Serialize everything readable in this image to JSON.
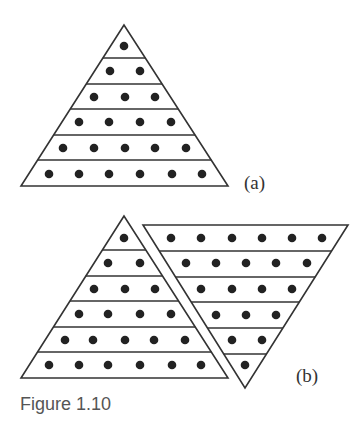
{
  "figure": {
    "caption": "Figure 1.10",
    "label_a": "(a)",
    "label_b": "(b)",
    "stroke_color": "#333333",
    "dot_color": "#222222"
  },
  "panel_a": {
    "description": "Triangular arrangement of dots, rows of 1 to 6",
    "triangle": {
      "apex": [
        124,
        25
      ],
      "base_left": [
        21,
        186
      ],
      "base_right": [
        228,
        186
      ]
    },
    "row_lines_y": [
      58,
      84,
      109,
      135,
      160
    ],
    "rows": [
      {
        "y": 46,
        "x": [
          124
        ]
      },
      {
        "y": 71,
        "x": [
          110,
          140
        ]
      },
      {
        "y": 97,
        "x": [
          94,
          125,
          155
        ]
      },
      {
        "y": 122,
        "x": [
          79,
          109,
          140,
          171
        ]
      },
      {
        "y": 148,
        "x": [
          63,
          94,
          125,
          155,
          186
        ]
      },
      {
        "y": 174,
        "x": [
          49,
          79,
          109,
          140,
          172,
          202
        ]
      }
    ]
  },
  "panel_b": {
    "description": "Two triangles of dots combined into a parallelogram (1..6 plus inverted 6..1)",
    "left_triangle": {
      "apex": [
        124,
        216
      ],
      "base_left": [
        21,
        378
      ],
      "base_right": [
        228,
        378
      ]
    },
    "left_row_lines_y": [
      250,
      276,
      301,
      327,
      352
    ],
    "left_rows": [
      {
        "y": 238,
        "x": [
          124
        ]
      },
      {
        "y": 263,
        "x": [
          108,
          140
        ]
      },
      {
        "y": 289,
        "x": [
          94,
          125,
          155
        ]
      },
      {
        "y": 314,
        "x": [
          79,
          108,
          140,
          171
        ]
      },
      {
        "y": 340,
        "x": [
          65,
          93,
          125,
          154,
          185
        ]
      },
      {
        "y": 365,
        "x": [
          49,
          79,
          108,
          140,
          172,
          201
        ]
      }
    ],
    "right_triangle": {
      "top_left": [
        143,
        225
      ],
      "top_right": [
        348,
        225
      ],
      "bottom": [
        245,
        388
      ]
    },
    "right_row_lines_y": [
      251,
      277,
      302,
      328,
      354
    ],
    "right_rows": [
      {
        "y": 238,
        "x": [
          171,
          201,
          232,
          262,
          292,
          322
        ]
      },
      {
        "y": 263,
        "x": [
          186,
          216,
          246,
          276,
          307
        ]
      },
      {
        "y": 289,
        "x": [
          201,
          232,
          262,
          292
        ]
      },
      {
        "y": 315,
        "x": [
          216,
          246,
          276
        ]
      },
      {
        "y": 340,
        "x": [
          232,
          262
        ]
      },
      {
        "y": 365,
        "x": [
          245
        ]
      }
    ]
  }
}
